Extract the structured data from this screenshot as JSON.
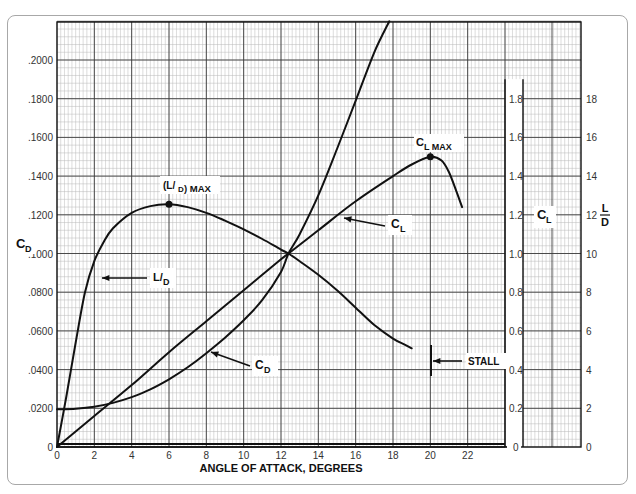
{
  "chart_data": {
    "type": "line",
    "title": "",
    "xlabel": "ANGLE OF ATTACK, DEGREES",
    "ylabel_left": "CD",
    "ylabel_right_1": "CL",
    "ylabel_right_2": "L/D",
    "xlim": [
      0,
      24
    ],
    "ylim_left": [
      0,
      0.22
    ],
    "ylim_right_cl": [
      0,
      2.2
    ],
    "ylim_right_ld": [
      0,
      22
    ],
    "grid": true,
    "x_ticks": [
      "0",
      "2",
      "4",
      "6",
      "8",
      "10",
      "12",
      "14",
      "16",
      "18",
      "20",
      "22"
    ],
    "y_ticks_left": [
      "0",
      ".0200",
      ".0400",
      ".0600",
      ".0800",
      ".1000",
      ".1200",
      ".1400",
      ".1600",
      ".1800",
      ".2000"
    ],
    "y_ticks_cl": [
      "0",
      "0.2",
      "0.4",
      "0.6",
      "0.8",
      "1.0",
      "1.2",
      "1.4",
      "1.6",
      "1.8"
    ],
    "y_ticks_ld": [
      "0",
      "2",
      "4",
      "6",
      "8",
      "10",
      "12",
      "14",
      "16",
      "18"
    ],
    "series": [
      {
        "name": "CL",
        "axis": "cl",
        "x": [
          0,
          2,
          4,
          6,
          8,
          10,
          12,
          12.4,
          14,
          16,
          18,
          19,
          20,
          20.6,
          21,
          21.4,
          21.7
        ],
        "values": [
          0.0,
          0.16,
          0.32,
          0.49,
          0.65,
          0.81,
          0.97,
          1.0,
          1.12,
          1.27,
          1.4,
          1.46,
          1.5,
          1.48,
          1.42,
          1.32,
          1.24
        ]
      },
      {
        "name": "CD",
        "axis": "left",
        "x": [
          0,
          1,
          2,
          3,
          4,
          5,
          6,
          7,
          8,
          9,
          10,
          11,
          12,
          12.4,
          13,
          14,
          15,
          16,
          17,
          17.8
        ],
        "values": [
          0.0195,
          0.0198,
          0.0208,
          0.0228,
          0.0258,
          0.0298,
          0.035,
          0.0412,
          0.0485,
          0.0565,
          0.0655,
          0.076,
          0.0905,
          0.1,
          0.11,
          0.13,
          0.154,
          0.179,
          0.204,
          0.22
        ]
      },
      {
        "name": "L/D",
        "axis": "ld",
        "x": [
          0,
          0.5,
          1,
          1.5,
          2,
          2.5,
          3,
          4,
          5,
          6,
          7,
          8,
          9,
          10,
          11,
          12,
          12.4,
          13,
          14,
          15,
          16,
          17,
          18,
          18.6,
          19
        ],
        "values": [
          0.0,
          2.6,
          5.4,
          8.0,
          9.6,
          10.6,
          11.3,
          12.1,
          12.45,
          12.55,
          12.4,
          12.1,
          11.7,
          11.25,
          10.75,
          10.2,
          10.0,
          9.6,
          8.9,
          8.1,
          7.2,
          6.3,
          5.6,
          5.3,
          5.1
        ]
      }
    ],
    "annotations": [
      {
        "text": "(L/D) MAX",
        "x": 6,
        "value": 12.55,
        "axis": "ld",
        "marker": "dot"
      },
      {
        "text": "CL MAX",
        "x": 20,
        "value": 1.5,
        "axis": "cl",
        "marker": "dot"
      },
      {
        "text": "L/D",
        "pointer_to": "L/D curve at about 1.5 deg"
      },
      {
        "text": "CL",
        "pointer_to": "CL curve at about 14.5 deg"
      },
      {
        "text": "CD",
        "pointer_to": "CD curve at about 7 deg"
      },
      {
        "text": "STALL",
        "x": 19.2,
        "marker": "vertical bar"
      }
    ]
  },
  "labels": {
    "xlabel": "ANGLE OF ATTACK, DEGREES",
    "cd": "C",
    "cd_sub": "D",
    "cl": "C",
    "cl_sub": "L",
    "ld_num": "L",
    "ld_den": "D",
    "ldmax_main": "(L/",
    "ldmax_sub": "D",
    "ldmax_tail": ") MAX",
    "clmax_main": "C",
    "clmax_sub": "L MAX",
    "ld_callout": "L/",
    "ld_callout_sub": "D",
    "cl_callout": "C",
    "cl_callout_sub": "L",
    "cd_callout": "C",
    "cd_callout_sub": "D",
    "stall": "STALL"
  },
  "colors": {
    "major_grid": "#3a3a3a",
    "minor_grid": "#b9b9b9",
    "curve": "#111111",
    "frame": "#111111"
  }
}
